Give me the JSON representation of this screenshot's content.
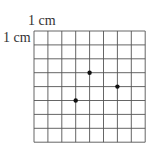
{
  "labels": {
    "top": "1 cm",
    "left": "1 cm"
  },
  "grid": {
    "columns": 8,
    "rows": 8,
    "cell_size_cm": 1,
    "line_color": "#555555"
  },
  "points": [
    {
      "name": "point-a",
      "col": 4,
      "row": 3
    },
    {
      "name": "point-b",
      "col": 6,
      "row": 4
    },
    {
      "name": "point-c",
      "col": 3,
      "row": 5
    }
  ],
  "point_color": "#111111"
}
